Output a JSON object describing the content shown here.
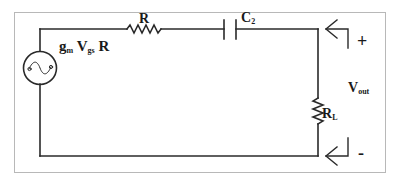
{
  "diagram": {
    "type": "circuit-schematic",
    "source": {
      "label_main1": "g",
      "label_sub1": "m",
      "label_main2": "V",
      "label_sub2": "gs",
      "label_main3": "R",
      "symbol": "ac-voltage-source"
    },
    "series_resistor": {
      "label": "R"
    },
    "capacitor": {
      "label_main": "C",
      "label_sub": "2"
    },
    "load_resistor": {
      "label_main": "R",
      "label_sub": "L"
    },
    "output": {
      "label_main": "V",
      "label_sub": "out",
      "plus": "+",
      "minus": "-"
    },
    "colors": {
      "wire": "#2a2a2a",
      "frame": "#b8b8b8",
      "background": "#ffffff"
    }
  }
}
